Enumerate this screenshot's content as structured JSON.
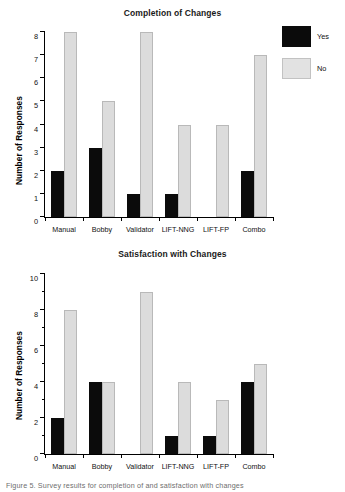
{
  "figure": {
    "caption_partial": "Figure 5. Survey results for completion of and satisfaction with changes"
  },
  "legend": {
    "yes_label": "Yes",
    "no_label": "No",
    "yes_color": "#0b0b0b",
    "no_color": "#dcdcdc"
  },
  "chart_data": [
    {
      "type": "bar",
      "title": "Completion of Changes",
      "xlabel": "",
      "ylabel": "Number of Responses",
      "categories": [
        "Manual",
        "Bobby",
        "Validator",
        "LIFT-NNG",
        "LIFT-FP",
        "Combo"
      ],
      "series": [
        {
          "name": "Yes",
          "color": "#0b0b0b",
          "values": [
            2,
            3,
            1,
            1,
            0,
            2
          ]
        },
        {
          "name": "No",
          "color": "#dcdcdc",
          "values": [
            8,
            5,
            8,
            4,
            4,
            7
          ]
        }
      ],
      "ylim": [
        0,
        8
      ],
      "yticks": [
        0,
        1,
        2,
        3,
        4,
        5,
        6,
        7,
        8
      ],
      "ytick_labels": [
        "0",
        "1",
        "2",
        "3",
        "4",
        "5",
        "6",
        "7",
        "8"
      ],
      "grid": false,
      "legend_position": "right-outside"
    },
    {
      "type": "bar",
      "title": "Satisfaction with Changes",
      "xlabel": "",
      "ylabel": "Number of Responses",
      "categories": [
        "Manual",
        "Bobby",
        "Validator",
        "LIFT-NNG",
        "LIFT-FP",
        "Combo"
      ],
      "series": [
        {
          "name": "Yes",
          "color": "#0b0b0b",
          "values": [
            2,
            4,
            0,
            1,
            1,
            4
          ]
        },
        {
          "name": "No",
          "color": "#dcdcdc",
          "values": [
            8,
            4,
            9,
            4,
            3,
            5
          ]
        }
      ],
      "ylim": [
        0,
        10
      ],
      "yticks": [
        0,
        2,
        4,
        6,
        8,
        10
      ],
      "ytick_labels": [
        "0",
        "2",
        "4",
        "6",
        "8",
        "10"
      ],
      "minor_yticks": [
        1,
        3,
        5,
        7,
        9
      ],
      "grid": false,
      "legend_position": "right-outside"
    }
  ]
}
